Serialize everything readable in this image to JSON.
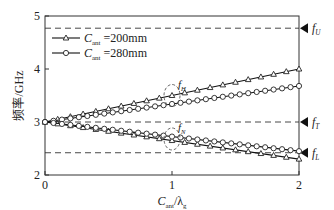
{
  "chart_data": {
    "type": "line",
    "title": "",
    "xlabel": "C_ant/λ_g",
    "xlabel_main": "C",
    "xlabel_sub": "ant",
    "xlabel_rest": "/λ",
    "xlabel_sub2": "g",
    "ylabel": "频率/GHz",
    "xlim": [
      0,
      2
    ],
    "ylim": [
      2,
      5
    ],
    "xticks": [
      "0",
      "1",
      "2"
    ],
    "yticks": [
      "2",
      "3",
      "4",
      "5"
    ],
    "grid": false,
    "legend_position": "upper-left",
    "series": [
      {
        "name": "C_ant =200mm",
        "legend_main": "C",
        "legend_sub": "ant",
        "legend_value": " =200mm",
        "marker": "triangle",
        "upper_branch": {
          "x": [
            0,
            2
          ],
          "y": [
            3.0,
            4.0
          ]
        },
        "lower_branch": {
          "x": [
            0,
            2
          ],
          "y": [
            3.0,
            2.3
          ]
        }
      },
      {
        "name": "C_ant =280mm",
        "legend_main": "C",
        "legend_sub": "ant",
        "legend_value": " =280mm",
        "marker": "circle",
        "upper_branch": {
          "x": [
            0,
            2
          ],
          "y": [
            3.0,
            3.68
          ]
        },
        "lower_branch": {
          "x": [
            0,
            2
          ],
          "y": [
            3.0,
            2.45
          ]
        }
      }
    ],
    "reference_lines": [
      {
        "label": "f",
        "sub": "U",
        "y": 4.77
      },
      {
        "label": "f",
        "sub": "T",
        "y": 3.0
      },
      {
        "label": "f",
        "sub": "L",
        "y": 2.42
      }
    ],
    "annotations": [
      {
        "label": "f",
        "sub": "H",
        "x": 1.0,
        "y": 3.5
      },
      {
        "label": "f",
        "sub": "N",
        "x": 1.0,
        "y": 2.68
      }
    ]
  }
}
